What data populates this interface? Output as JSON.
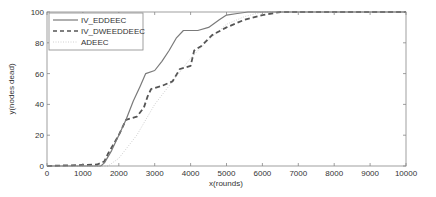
{
  "chart_data": {
    "type": "line",
    "title": "",
    "xlabel": "x(rounds)",
    "ylabel": "y(nodes dead)",
    "xlim": [
      0,
      10000
    ],
    "ylim": [
      0,
      100
    ],
    "xticks": [
      0,
      1000,
      2000,
      3000,
      4000,
      5000,
      6000,
      7000,
      8000,
      9000,
      10000
    ],
    "yticks": [
      0,
      20,
      40,
      60,
      80,
      100
    ],
    "grid": false,
    "legend_position": "upper left",
    "series": [
      {
        "name": "IV_EDDEEC",
        "style": "solid",
        "color": "#7a7a7a",
        "x": [
          0,
          1500,
          1600,
          1800,
          2000,
          2200,
          2400,
          2600,
          2750,
          3000,
          3200,
          3400,
          3600,
          3800,
          4200,
          4500,
          4800,
          5000,
          5300,
          5600,
          10000
        ],
        "y": [
          0,
          0,
          2,
          10,
          20,
          30,
          42,
          52,
          60,
          62,
          68,
          75,
          83,
          88,
          88,
          90,
          95,
          98,
          99,
          100,
          100
        ]
      },
      {
        "name": "IV_DWEEDDEEC",
        "style": "dashed",
        "color": "#555555",
        "x": [
          0,
          1400,
          1600,
          1700,
          2000,
          2200,
          2500,
          2700,
          2800,
          2900,
          3200,
          3500,
          3700,
          4000,
          4100,
          4300,
          4600,
          5000,
          5500,
          6000,
          6500,
          10000
        ],
        "y": [
          0,
          1,
          3,
          8,
          20,
          30,
          32,
          38,
          45,
          50,
          52,
          55,
          63,
          65,
          75,
          78,
          85,
          90,
          95,
          98,
          100,
          100
        ]
      },
      {
        "name": "ADEEC",
        "style": "dotted",
        "color": "#d0d0d0",
        "x": [
          0,
          1700,
          2000,
          2500,
          3000,
          3500,
          4000,
          4500,
          5000,
          5500,
          6000,
          10000
        ],
        "y": [
          0,
          0,
          5,
          20,
          40,
          55,
          70,
          82,
          92,
          97,
          100,
          100
        ]
      }
    ]
  },
  "axis": {
    "xlabel": "x(rounds)",
    "ylabel": "y(nodes dead)",
    "xtick_labels": [
      "0",
      "1000",
      "2000",
      "3000",
      "4000",
      "5000",
      "6000",
      "7000",
      "8000",
      "9000",
      "10000"
    ],
    "ytick_labels": [
      "0",
      "20",
      "40",
      "60",
      "80",
      "100"
    ]
  },
  "legend": {
    "items": [
      {
        "label": "IV_EDDEEC"
      },
      {
        "label": "IV_DWEEDDEEC"
      },
      {
        "label": "ADEEC"
      }
    ]
  }
}
